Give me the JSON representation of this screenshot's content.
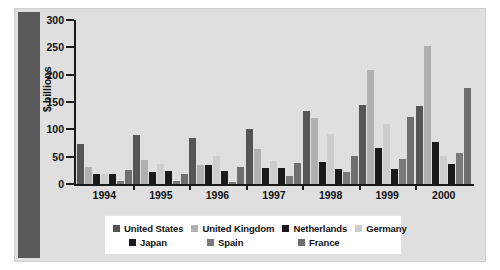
{
  "axis_title": "$ billions",
  "y_ticks": [
    "0",
    "50",
    "100",
    "150",
    "200",
    "250",
    "300"
  ],
  "legend": {
    "row1": [
      {
        "label": "United States",
        "color": "#555555"
      },
      {
        "label": "United Kingdom",
        "color": "#b0b0b0"
      },
      {
        "label": "Netherlands",
        "color": "#1a1a1a"
      },
      {
        "label": "Germany",
        "color": "#cdcdcd"
      }
    ],
    "row2": [
      {
        "label": "Japan",
        "color": "#1a1a1a"
      },
      {
        "label": "Spain",
        "color": "#7a7a7a"
      },
      {
        "label": "France",
        "color": "#6e6e6e"
      }
    ]
  },
  "chart_data": {
    "type": "bar",
    "title": "",
    "xlabel": "",
    "ylabel": "$ billions",
    "ylim": [
      0,
      300
    ],
    "ytick_step": 50,
    "grid": false,
    "legend_position": "bottom",
    "categories": [
      "1994",
      "1995",
      "1996",
      "1997",
      "1998",
      "1999",
      "2000"
    ],
    "series": [
      {
        "name": "United States",
        "color": "#555555",
        "values": [
          73,
          90,
          85,
          101,
          133,
          144,
          142
        ]
      },
      {
        "name": "United Kingdom",
        "color": "#b0b0b0",
        "values": [
          32,
          44,
          35,
          64,
          121,
          208,
          253
        ]
      },
      {
        "name": "Netherlands",
        "color": "#1a1a1a",
        "values": [
          19,
          22,
          34,
          30,
          40,
          65,
          76
        ]
      },
      {
        "name": "Germany",
        "color": "#cdcdcd",
        "values": [
          18,
          37,
          52,
          43,
          91,
          110,
          51
        ]
      },
      {
        "name": "Japan",
        "color": "#1a1a1a",
        "values": [
          18,
          23,
          24,
          29,
          27,
          27,
          37
        ]
      },
      {
        "name": "Spain",
        "color": "#7a7a7a",
        "values": [
          6,
          5,
          4,
          15,
          22,
          46,
          57
        ]
      },
      {
        "name": "France",
        "color": "#6e6e6e",
        "values": [
          26,
          18,
          31,
          38,
          51,
          123,
          176
        ]
      }
    ]
  }
}
